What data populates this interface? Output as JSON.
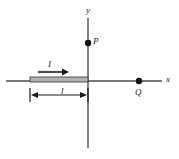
{
  "figure": {
    "type": "physics-diagram",
    "width": 179,
    "height": 159,
    "background_color": "#ffffff",
    "line_color": "#4d4d4d",
    "ink_color": "#1a1a1a",
    "wire_fill_color": "#b3b3b3"
  },
  "axes": {
    "x_axis": {
      "label": "x",
      "label_x": 166,
      "label_y": 76,
      "y": 81,
      "x_start": 6,
      "x_end": 162
    },
    "y_axis": {
      "label": "y",
      "label_x": 86,
      "label_y": 6,
      "x": 88,
      "y_start": 18,
      "y_end": 148
    },
    "origin": {
      "x": 88,
      "y": 81
    }
  },
  "wire": {
    "name": "current-carrying-wire",
    "left_x": 30,
    "right_x": 88,
    "top_y": 77,
    "bottom_y": 82,
    "fill": "#b3b3b3",
    "stroke": "#333333"
  },
  "current": {
    "symbol": "I",
    "label_x": 48,
    "label_y": 62,
    "arrow_y": 72,
    "arrow_x_start": 38,
    "arrow_x_end": 64,
    "direction": "positive-x"
  },
  "length_dimension": {
    "symbol": "l",
    "label_x": 61,
    "label_y": 88,
    "line_y": 95,
    "left_x": 30,
    "right_x": 88,
    "tick_top": 88,
    "tick_bottom": 102
  },
  "points": [
    {
      "name": "point-p",
      "label": "P",
      "dot_x": 88,
      "dot_y": 43,
      "label_x": 93,
      "label_y": 37,
      "radius": 3.2,
      "on_axis": "y"
    },
    {
      "name": "point-q",
      "label": "Q",
      "dot_x": 139,
      "dot_y": 81,
      "label_x": 135,
      "label_y": 88,
      "radius": 3.2,
      "on_axis": "x"
    }
  ]
}
